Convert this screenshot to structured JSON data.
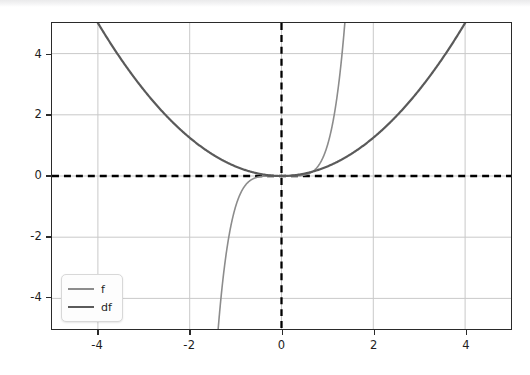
{
  "figure": {
    "background_color": "#ffffff",
    "axes_edge_color": "#2a2a2a",
    "grid_color": "#c9c9c9",
    "zero_line_color": "#000000"
  },
  "legend": {
    "entries": [
      {
        "label": "f",
        "color": "#8c8c8c"
      },
      {
        "label": "df",
        "color": "#5a5a5a"
      }
    ]
  },
  "axes": {
    "x_ticks": [
      "-4",
      "-2",
      "0",
      "2",
      "4"
    ],
    "y_ticks": [
      "4",
      "2",
      "0",
      "-2",
      "-4"
    ]
  },
  "chart_data": {
    "type": "line",
    "title": "",
    "xlabel": "",
    "ylabel": "",
    "xlim": [
      -5.0,
      5.0
    ],
    "ylim": [
      -5.0,
      5.0
    ],
    "grid": true,
    "legend_position": "lower left",
    "xticks": [
      -4,
      -2,
      0,
      2,
      4
    ],
    "yticks": [
      -4,
      -2,
      0,
      2,
      4
    ],
    "annotations": [
      {
        "kind": "hline",
        "y": 0,
        "style": "dashed",
        "color": "#000000"
      },
      {
        "kind": "vline",
        "x": 0,
        "style": "dashed",
        "color": "#000000"
      }
    ],
    "series": [
      {
        "name": "f",
        "color": "#8c8c8c",
        "linewidth": 1.6,
        "expression": "x^5",
        "x": [
          -1.8,
          -1.7,
          -1.6,
          -1.5,
          -1.4,
          -1.3,
          -1.2,
          -1.1,
          -1.0,
          -0.9,
          -0.8,
          -0.7,
          -0.6,
          -0.5,
          -0.4,
          -0.3,
          -0.2,
          -0.1,
          0.0,
          0.1,
          0.2,
          0.3,
          0.4,
          0.5,
          0.6,
          0.7,
          0.8,
          0.9,
          1.0,
          1.1,
          1.2,
          1.3,
          1.4,
          1.5,
          1.6,
          1.7,
          1.8
        ],
        "y": [
          -18.896,
          -14.199,
          -10.486,
          -7.594,
          -5.378,
          -3.713,
          -2.488,
          -1.611,
          -1.0,
          -0.59,
          -0.328,
          -0.168,
          -0.078,
          -0.031,
          -0.01,
          -0.002,
          0.0,
          0.0,
          0.0,
          0.0,
          0.0,
          0.002,
          0.01,
          0.031,
          0.078,
          0.168,
          0.328,
          0.59,
          1.0,
          1.611,
          2.488,
          3.713,
          5.378,
          7.594,
          10.486,
          14.199,
          18.896
        ]
      },
      {
        "name": "df",
        "color": "#5a5a5a",
        "linewidth": 2.2,
        "expression": "x^2/3.2",
        "x": [
          -5.0,
          -4.5,
          -4.0,
          -3.5,
          -3.0,
          -2.5,
          -2.0,
          -1.5,
          -1.0,
          -0.5,
          0.0,
          0.5,
          1.0,
          1.5,
          2.0,
          2.5,
          3.0,
          3.5,
          4.0,
          4.5,
          5.0
        ],
        "y": [
          7.813,
          6.328,
          5.0,
          3.828,
          2.813,
          1.953,
          1.25,
          0.703,
          0.313,
          0.078,
          0.0,
          0.078,
          0.313,
          0.703,
          1.25,
          1.953,
          2.813,
          3.828,
          5.0,
          6.328,
          7.813
        ]
      }
    ]
  }
}
